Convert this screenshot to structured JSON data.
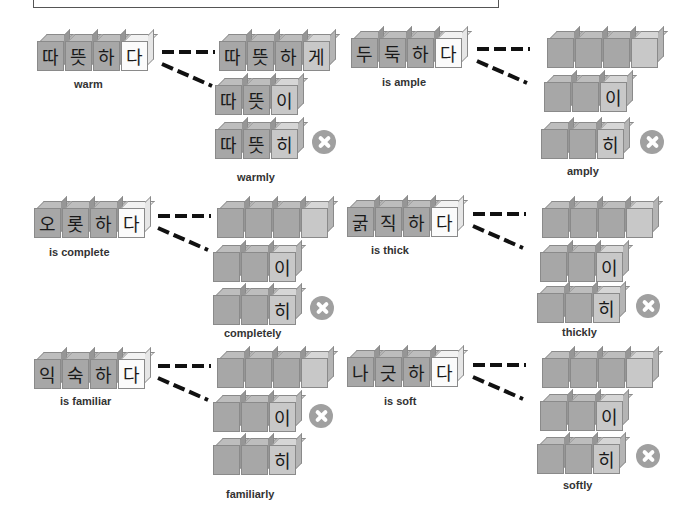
{
  "colors": {
    "cube_dark": "#a7a7a7",
    "cube_light": "#c8c8c8",
    "cube_white": "#fbfbfb",
    "x_icon": "#a0a0a0",
    "dash": "#111111"
  },
  "panels": [
    {
      "id": "warm",
      "source": {
        "syllables": [
          "따",
          "뜻",
          "하",
          "다"
        ],
        "meaning": "is warm",
        "label": "warm"
      },
      "forms": [
        {
          "syllables": [
            "따",
            "뜻",
            "하",
            "게"
          ],
          "correct": true
        },
        {
          "syllables": [
            "따",
            "뜻",
            "이"
          ],
          "correct": true
        },
        {
          "syllables": [
            "따",
            "뜻",
            "히"
          ],
          "correct": false
        }
      ],
      "result_label": "warmly"
    },
    {
      "id": "ample",
      "source": {
        "syllables": [
          "두",
          "둑",
          "하",
          "다"
        ],
        "label": "is ample"
      },
      "forms": [
        {
          "syllables": [
            "",
            "",
            "",
            ""
          ],
          "correct": true
        },
        {
          "syllables": [
            "",
            "",
            "이"
          ],
          "correct": true
        },
        {
          "syllables": [
            "",
            "",
            "히"
          ],
          "correct": false
        }
      ],
      "result_label": "amply"
    },
    {
      "id": "complete",
      "source": {
        "syllables": [
          "오",
          "롯",
          "하",
          "다"
        ],
        "label": "is complete"
      },
      "forms": [
        {
          "syllables": [
            "",
            "",
            "",
            ""
          ],
          "correct": true
        },
        {
          "syllables": [
            "",
            "",
            "이"
          ],
          "correct": true
        },
        {
          "syllables": [
            "",
            "",
            "히"
          ],
          "correct": false
        }
      ],
      "result_label": "completely"
    },
    {
      "id": "thick",
      "source": {
        "syllables": [
          "굵",
          "직",
          "하",
          "다"
        ],
        "label": "is thick"
      },
      "forms": [
        {
          "syllables": [
            "",
            "",
            "",
            ""
          ],
          "correct": true
        },
        {
          "syllables": [
            "",
            "",
            "이"
          ],
          "correct": true
        },
        {
          "syllables": [
            "",
            "",
            "히"
          ],
          "correct": false
        }
      ],
      "result_label": "thickly"
    },
    {
      "id": "familiar",
      "source": {
        "syllables": [
          "익",
          "숙",
          "하",
          "다"
        ],
        "label": "is familiar"
      },
      "forms": [
        {
          "syllables": [
            "",
            "",
            "",
            ""
          ],
          "correct": true
        },
        {
          "syllables": [
            "",
            "",
            "이"
          ],
          "correct": false
        },
        {
          "syllables": [
            "",
            "",
            "히"
          ],
          "correct": true
        }
      ],
      "result_label": "familiarly"
    },
    {
      "id": "soft",
      "source": {
        "syllables": [
          "나",
          "긋",
          "하",
          "다"
        ],
        "label": "is soft"
      },
      "forms": [
        {
          "syllables": [
            "",
            "",
            "",
            ""
          ],
          "correct": true
        },
        {
          "syllables": [
            "",
            "",
            "이"
          ],
          "correct": true
        },
        {
          "syllables": [
            "",
            "",
            "히"
          ],
          "correct": false
        }
      ],
      "result_label": "softly"
    }
  ]
}
